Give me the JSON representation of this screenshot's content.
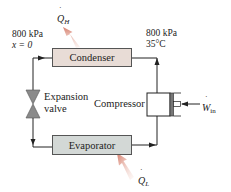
{
  "diagram": {
    "type": "vapor-compression refrigeration cycle",
    "components": {
      "condenser": {
        "label": "Condenser",
        "fill": "#e8dcd6"
      },
      "evaporator": {
        "label": "Evaporator",
        "fill": "#d3d8d6"
      },
      "compressor": {
        "label": "Compressor"
      },
      "expansion_valve": {
        "label_line1": "Expansion",
        "label_line2": "valve"
      }
    },
    "states": {
      "condenser_exit": {
        "pressure": "800 kPa",
        "quality": "x = 0"
      },
      "compressor_exit": {
        "pressure": "800 kPa",
        "temperature": "35°C"
      }
    },
    "energy_flows": {
      "heat_out": {
        "symbol": "Q",
        "subscript": "H",
        "arrow_color": "#d9897a"
      },
      "heat_in": {
        "symbol": "Q",
        "subscript": "L",
        "arrow_color": "#d9897a"
      },
      "work_in": {
        "symbol": "W",
        "subscript": "in"
      }
    },
    "line_color": "#222222"
  }
}
